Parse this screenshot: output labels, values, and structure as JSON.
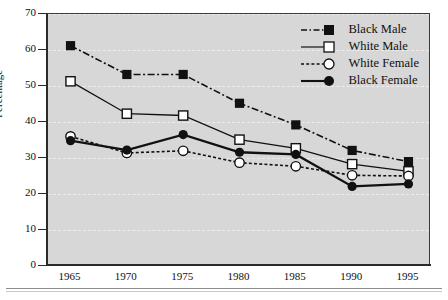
{
  "chart_data": {
    "type": "line",
    "title": "",
    "xlabel": "",
    "ylabel": "Percentage",
    "x": [
      1965,
      1970,
      1975,
      1980,
      1985,
      1990,
      1995
    ],
    "xtick_labels": [
      "1965",
      "1970",
      "1975",
      "1980",
      "1985",
      "1990",
      "1995"
    ],
    "ytick_labels": [
      "0",
      "10",
      "20",
      "30",
      "40",
      "50",
      "60",
      "70"
    ],
    "yticks": [
      0,
      10,
      20,
      30,
      40,
      50,
      60,
      70
    ],
    "ylim": [
      0,
      70
    ],
    "xlim": [
      1963,
      1997
    ],
    "grid": true,
    "grid_axis": "y",
    "legend_position": "top-right-inside",
    "plot_background": "#d7d7d7",
    "series": [
      {
        "name": "Black Male",
        "values": [
          61.2,
          53.2,
          53.2,
          45.2,
          39.2,
          32.1,
          29.0
        ],
        "line_style": "dash-dot",
        "marker": "filled-square",
        "color": "#111111"
      },
      {
        "name": "White Male",
        "values": [
          51.3,
          42.3,
          41.8,
          35.1,
          32.7,
          28.3,
          26.3
        ],
        "line_style": "solid",
        "marker": "open-square",
        "color": "#111111"
      },
      {
        "name": "White Female",
        "values": [
          36.0,
          31.4,
          32.0,
          28.7,
          27.7,
          25.2,
          25.0
        ],
        "line_style": "dotted",
        "marker": "open-circle",
        "color": "#111111"
      },
      {
        "name": "Black Female",
        "values": [
          34.8,
          32.2,
          36.5,
          31.6,
          31.0,
          22.1,
          22.8
        ],
        "line_style": "solid-bold",
        "marker": "filled-circle",
        "color": "#111111"
      }
    ]
  },
  "legend": {
    "items": [
      {
        "label": "Black Male"
      },
      {
        "label": "White Male"
      },
      {
        "label": "White Female"
      },
      {
        "label": "Black Female"
      }
    ]
  }
}
